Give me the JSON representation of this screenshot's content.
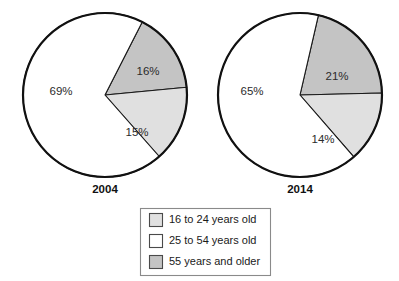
{
  "chart_data": {
    "type": "pie",
    "title": "",
    "legend_position": "bottom",
    "categories": [
      "16 to 24 years old",
      "25 to 54 years old",
      "55 years and older"
    ],
    "colors": {
      "16 to 24 years old": "#e0e0e0",
      "25 to 54 years old": "#ffffff",
      "55 years and older": "#c4c4c4",
      "outline": "#111111",
      "text": "#1a1a1a"
    },
    "charts": [
      {
        "name": "2004",
        "label": "2004",
        "slices": [
          {
            "category": "55 years and older",
            "value": 16,
            "label": "16%"
          },
          {
            "category": "16 to 24 years old",
            "value": 15,
            "label": "15%"
          },
          {
            "category": "25 to 54 years old",
            "value": 69,
            "label": "69%"
          }
        ]
      },
      {
        "name": "2014",
        "label": "2014",
        "slices": [
          {
            "category": "55 years and older",
            "value": 21,
            "label": "21%"
          },
          {
            "category": "16 to 24 years old",
            "value": 14,
            "label": "14%"
          },
          {
            "category": "25 to 54 years old",
            "value": 65,
            "label": "65%"
          }
        ]
      }
    ]
  },
  "legend": {
    "items": [
      {
        "label": "16 to 24 years old",
        "swatch": "#e0e0e0"
      },
      {
        "label": "25 to 54 years old",
        "swatch": "#ffffff"
      },
      {
        "label": "55 years and older",
        "swatch": "#c4c4c4"
      }
    ]
  },
  "geometry": {
    "pies": [
      {
        "cx": 105,
        "cy": 95,
        "r": 82,
        "start_angle": 27,
        "label_x": 105,
        "label_y": 193
      },
      {
        "cx": 300,
        "cy": 95,
        "r": 82,
        "start_angle": 13,
        "label_x": 300,
        "label_y": 193
      }
    ],
    "label_offsets": [
      [
        {
          "x": 148,
          "y": 75
        },
        {
          "x": 137,
          "y": 136
        },
        {
          "x": 61,
          "y": 95
        }
      ],
      [
        {
          "x": 337,
          "y": 80
        },
        {
          "x": 323,
          "y": 143
        },
        {
          "x": 252,
          "y": 95
        }
      ]
    ],
    "legend": {
      "x": 140,
      "y": 208,
      "w": 130,
      "h": 67
    }
  }
}
